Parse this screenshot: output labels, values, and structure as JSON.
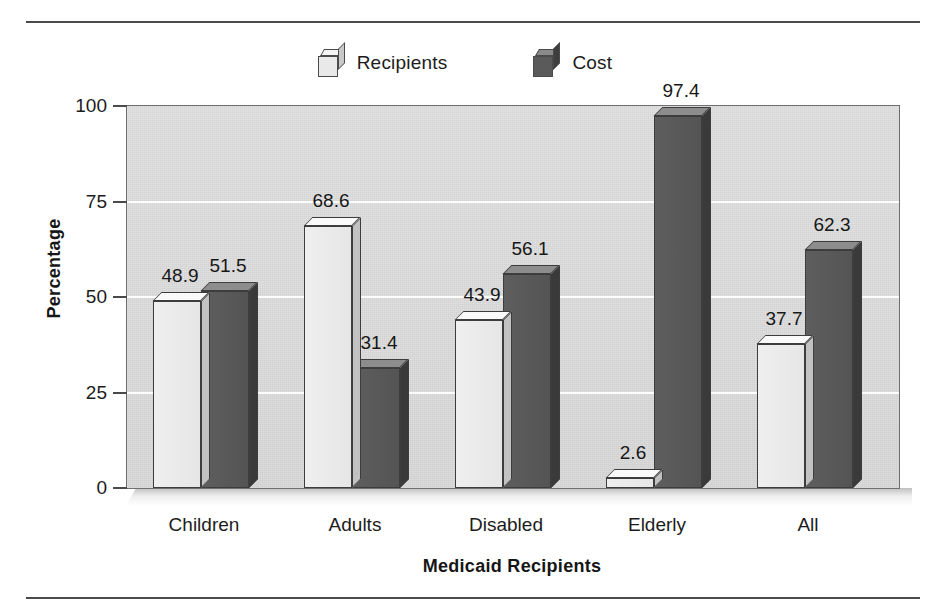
{
  "chart_data": {
    "type": "bar",
    "title": "",
    "xlabel": "Medicaid Recipients",
    "ylabel": "Percentage",
    "ylim": [
      0,
      100
    ],
    "yticks": [
      "0",
      "25",
      "50",
      "75",
      "100"
    ],
    "ytick_values": [
      0,
      25,
      50,
      75,
      100
    ],
    "grid": "horizontal white gridlines at 25, 50, 75",
    "legend_position": "top-center",
    "categories": [
      "Children",
      "Adults",
      "Disabled",
      "Elderly",
      "All"
    ],
    "series": [
      {
        "name": "Recipients",
        "color": "#e6e6e6",
        "values": [
          48.9,
          68.6,
          43.9,
          2.6,
          37.7
        ],
        "labels": [
          "48.9",
          "68.6",
          "43.9",
          "2.6",
          "37.7"
        ]
      },
      {
        "name": "Cost",
        "color": "#545454",
        "values": [
          51.5,
          31.4,
          56.1,
          97.4,
          62.3
        ],
        "labels": [
          "51.5",
          "31.4",
          "56.1",
          "97.4",
          "62.3"
        ]
      }
    ]
  },
  "legend": {
    "items": [
      {
        "label": "Recipients",
        "swatch": "light-cube-icon"
      },
      {
        "label": "Cost",
        "swatch": "dark-cube-icon"
      }
    ]
  },
  "axes": {
    "y_title": "Percentage",
    "x_title": "Medicaid Recipients"
  },
  "colors": {
    "plot_background": "#d9d9d9",
    "gridline": "#fdfdfd",
    "recipients_bar": "#e6e6e6",
    "cost_bar": "#545454",
    "frame": "#6f6f6f",
    "rule": "#4a4a4a",
    "text": "#1c1c1c"
  }
}
